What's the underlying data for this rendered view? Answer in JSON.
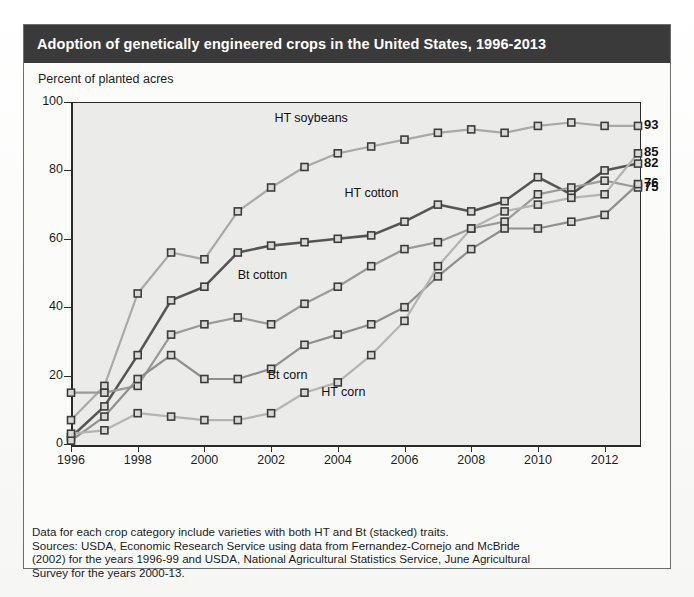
{
  "figure": {
    "title": "Adoption of genetically engineered crops in the United States, 1996-2013",
    "y_axis_title": "Percent of planted acres",
    "footnote_lines": [
      "Data for each crop category include varieties with both HT and Bt (stacked) traits.",
      "Sources: USDA, Economic Research Service using data from Fernandez-Cornejo and McBride",
      "(2002) for the years 1996-99 and USDA, National Agricultural Statistics Service, June Agricultural",
      "Survey for the years 2000-13."
    ]
  },
  "colors": {
    "title_bar": "#3a3a3a",
    "title_text": "#ffffff",
    "plot_background": "#ebebea",
    "axis": "#2b2b2b",
    "ht_soybeans": "#a9a9a9",
    "ht_cotton": "#555555",
    "bt_cotton": "#9a9a9a",
    "bt_corn": "#8f8f8f",
    "ht_corn": "#b4b4b4",
    "marker_fill": "#d8d8d8",
    "marker_stroke": "#3c3c3c"
  },
  "chart_data": {
    "type": "line",
    "title": "Adoption of genetically engineered crops in the United States, 1996-2013",
    "xlabel": "",
    "ylabel": "Percent of planted acres",
    "xlim": [
      1996,
      2013
    ],
    "ylim": [
      0,
      100
    ],
    "grid": false,
    "legend": "inline-labels",
    "x": [
      1996,
      1997,
      1998,
      1999,
      2000,
      2001,
      2002,
      2003,
      2004,
      2005,
      2006,
      2007,
      2008,
      2009,
      2010,
      2011,
      2012,
      2013
    ],
    "xtick_labels": [
      "1996",
      "1998",
      "2000",
      "2002",
      "2004",
      "2006",
      "2008",
      "2010",
      "2012"
    ],
    "xticks": [
      1996,
      1998,
      2000,
      2002,
      2004,
      2006,
      2008,
      2010,
      2012
    ],
    "ytick_labels": [
      "0",
      "20",
      "40",
      "60",
      "80",
      "100"
    ],
    "yticks": [
      0,
      20,
      40,
      60,
      80,
      100
    ],
    "series": [
      {
        "name": "HT soybeans",
        "color": "#a9a9a9",
        "end_value": 93,
        "label_x": 2002.1,
        "label_y": 95,
        "values": [
          7,
          17,
          44,
          56,
          54,
          68,
          75,
          81,
          85,
          87,
          89,
          91,
          92,
          91,
          93,
          94,
          93,
          93
        ]
      },
      {
        "name": "HT cotton",
        "color": "#555555",
        "end_value": 82,
        "label_x": 2004.2,
        "label_y": 73,
        "values": [
          2,
          11,
          26,
          42,
          46,
          56,
          58,
          59,
          60,
          61,
          65,
          70,
          68,
          71,
          78,
          73,
          80,
          82
        ]
      },
      {
        "name": "Bt cotton",
        "color": "#9a9a9a",
        "end_value": 75,
        "label_x": 2001.0,
        "label_y": 49,
        "values": [
          15,
          15,
          17,
          32,
          35,
          37,
          35,
          41,
          46,
          52,
          57,
          59,
          63,
          65,
          73,
          75,
          77,
          75
        ]
      },
      {
        "name": "Bt corn",
        "color": "#8f8f8f",
        "end_value": 76,
        "label_x": 2001.9,
        "label_y": 20,
        "values": [
          1,
          8,
          19,
          26,
          19,
          19,
          22,
          29,
          32,
          35,
          40,
          49,
          57,
          63,
          63,
          65,
          67,
          76
        ]
      },
      {
        "name": "HT corn",
        "color": "#b4b4b4",
        "end_value": 85,
        "label_x": 2003.5,
        "label_y": 15,
        "values": [
          3,
          4,
          9,
          8,
          7,
          7,
          9,
          15,
          18,
          26,
          36,
          52,
          63,
          68,
          70,
          72,
          73,
          85
        ]
      }
    ],
    "end_labels": [
      {
        "value": 93,
        "series": "HT soybeans"
      },
      {
        "value": 85,
        "series": "HT corn"
      },
      {
        "value": 82,
        "series": "HT cotton"
      },
      {
        "value": 76,
        "series": "Bt corn"
      },
      {
        "value": 75,
        "series": "Bt cotton"
      }
    ]
  }
}
